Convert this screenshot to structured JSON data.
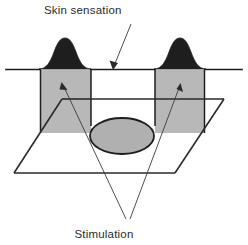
{
  "figure": {
    "title_label": "Skin sensation",
    "bottom_label": "Stimulation",
    "colors": {
      "hump_fill": "#1e1e1e",
      "slab_fill": "#b8b8b8",
      "ellipse_fill": "#b0b0b0",
      "outline": "#1e1e1e",
      "leader": "#3a3a3a",
      "background": "#ffffff"
    },
    "annotations": [
      {
        "name": "skin-sensation-callout",
        "label": "Skin sensation",
        "points_to": "skin-surface-line",
        "arrow_tip": [
          113,
          69
        ],
        "text_anchor": [
          44,
          14
        ]
      },
      {
        "name": "stimulation-callout-left",
        "label": "Stimulation",
        "points_to": "left-stimulation-slab",
        "arrow_tip": [
          62,
          83
        ],
        "text_anchor": [
          104,
          238
        ]
      },
      {
        "name": "stimulation-callout-right",
        "label": "Stimulation",
        "points_to": "right-stimulation-slab",
        "arrow_tip": [
          180,
          84
        ],
        "text_anchor": [
          104,
          238
        ]
      }
    ],
    "elements": [
      {
        "name": "skin-surface-line",
        "type": "line",
        "from": [
          6,
          69
        ],
        "to": [
          242,
          69
        ]
      },
      {
        "name": "left-sensation-hump",
        "type": "gaussian-peak",
        "center_x": 65,
        "baseline_y": 69,
        "peak_height": 31,
        "half_width": 26
      },
      {
        "name": "right-sensation-hump",
        "type": "gaussian-peak",
        "center_x": 180,
        "baseline_y": 69,
        "peak_height": 31,
        "half_width": 26
      },
      {
        "name": "left-stimulation-slab",
        "type": "rect",
        "x": 40,
        "y": 70,
        "width": 51,
        "height": 63
      },
      {
        "name": "right-stimulation-slab",
        "type": "rect",
        "x": 155,
        "y": 70,
        "width": 50,
        "height": 63
      },
      {
        "name": "stimulation-trough",
        "type": "notch",
        "left_x": 91,
        "right_x": 155,
        "top_y": 69,
        "bottom_y": 125
      },
      {
        "name": "receptive-field-ellipse",
        "type": "ellipse",
        "cx": 122,
        "cy": 136,
        "rx": 32,
        "ry": 18
      },
      {
        "name": "skin-plane-parallelogram",
        "type": "parallelogram",
        "corners": [
          [
            62,
            99
          ],
          [
            224,
            99
          ],
          [
            175,
            173
          ],
          [
            14,
            173
          ]
        ]
      }
    ]
  }
}
